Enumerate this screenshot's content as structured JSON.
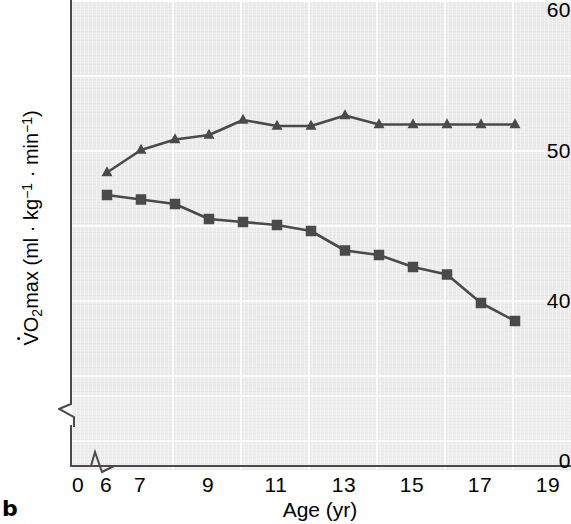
{
  "panel_letter": "b",
  "axes": {
    "y_label_parts": {
      "v": "V",
      "o": "O",
      "two": "2",
      "max": "max (ml · kg",
      "sup1": "−1",
      "middot": " · min",
      "sup2": "−1",
      "close": ")"
    },
    "y_label_plain": "V̇O2max (ml · kg−1 · min−1)",
    "y_ticks": [
      "60",
      "50",
      "40",
      "0"
    ],
    "y_tick_values": [
      60,
      50,
      40,
      0
    ],
    "x_label": "Age (yr)",
    "x_ticks": [
      "0",
      "6",
      "7",
      "9",
      "11",
      "13",
      "15",
      "17",
      "19"
    ],
    "x_tick_values": [
      0,
      6,
      7,
      9,
      11,
      13,
      15,
      17,
      19
    ],
    "y_axis_break": true,
    "x_axis_break": true
  },
  "colors": {
    "marker": "#4a4a4a",
    "line": "#4a4a4a",
    "panel_bg": "#ececec",
    "gridline": "#fbfbfb",
    "axis": "#4a4a4a",
    "text": "#000000"
  },
  "chart_data": {
    "type": "line",
    "title": "",
    "xlabel": "Age (yr)",
    "ylabel": "V̇O2max (ml · kg−1 · min−1)",
    "xlim": [
      5,
      19.6
    ],
    "ylim": [
      38.0,
      60.0
    ],
    "grid": true,
    "legend": "none",
    "x": [
      6,
      7,
      8,
      9,
      10,
      11,
      12,
      13,
      14,
      15,
      16,
      17,
      18
    ],
    "series": [
      {
        "name": "Boys",
        "marker": "triangle",
        "values": [
          48.5,
          50.0,
          50.7,
          51.0,
          52.0,
          51.6,
          51.6,
          52.3,
          51.7,
          51.7,
          51.7,
          51.7,
          51.7
        ]
      },
      {
        "name": "Girls",
        "marker": "square",
        "values": [
          47.0,
          46.7,
          46.4,
          45.4,
          45.2,
          45.0,
          44.6,
          43.3,
          43.0,
          42.2,
          41.7,
          39.8,
          38.6
        ]
      }
    ]
  }
}
